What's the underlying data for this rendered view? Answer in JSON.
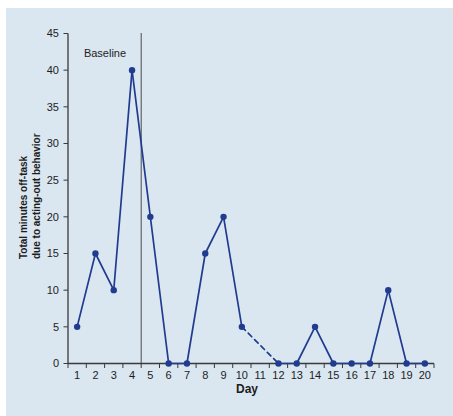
{
  "figure": {
    "bg_outer": "#ffffff",
    "bg_panel": "#dae6f0",
    "panel_left": 6,
    "panel_top": 8
  },
  "chart_data": {
    "type": "line",
    "title": "",
    "xlabel": "Day",
    "ylabel_lines": [
      "Total minutes off-task",
      "due to acting-out behavior"
    ],
    "x": [
      1,
      2,
      3,
      4,
      5,
      6,
      7,
      8,
      9,
      10,
      11,
      12,
      13,
      14,
      15,
      16,
      17,
      18,
      19,
      20
    ],
    "y": [
      5,
      15,
      10,
      40,
      20,
      0,
      0,
      15,
      20,
      5,
      null,
      0,
      0,
      5,
      0,
      0,
      0,
      10,
      0,
      0
    ],
    "ylim": [
      0,
      45
    ],
    "yticks": [
      0,
      5,
      10,
      15,
      20,
      25,
      30,
      35,
      40,
      45
    ],
    "dashed_between": [
      10,
      12
    ],
    "phase_line": {
      "x": 4.5,
      "label": "Baseline"
    },
    "legend": "none",
    "grid": false,
    "marker": "circle",
    "colors": {
      "series": "#213c8f",
      "axis": "#3a3a3a",
      "phase_line": "#4a4a4a",
      "text": "#1d1d1d",
      "panel_background": "#dae6f0"
    }
  }
}
